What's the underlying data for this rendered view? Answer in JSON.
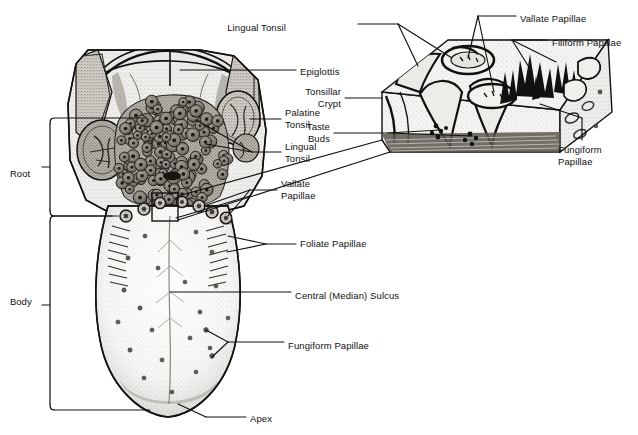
{
  "figure": {
    "type": "anatomical-diagram",
    "background": "#ffffff",
    "ink": "#000000"
  },
  "region_brackets": [
    {
      "id": "root",
      "label": "Root",
      "x": 10,
      "y": 168
    },
    {
      "id": "body",
      "label": "Body",
      "x": 10,
      "y": 296
    }
  ],
  "labels": [
    {
      "id": "lingual-tonsil-inset",
      "text": "Lingual Tonsil",
      "x": 286,
      "y": 22,
      "align": "right"
    },
    {
      "id": "vallate-papillae-inset",
      "text": "Vallate Papillae",
      "x": 520,
      "y": 13,
      "align": "left"
    },
    {
      "id": "filiform-papillae",
      "text": "Filiform Papillae",
      "x": 552,
      "y": 37,
      "align": "left"
    },
    {
      "id": "epiglottis",
      "text": "Epiglottis",
      "x": 300,
      "y": 66,
      "align": "left"
    },
    {
      "id": "palatine-tonsil",
      "text": "Palatine\nTonsil",
      "x": 285,
      "y": 107,
      "align": "left"
    },
    {
      "id": "tonsillar-crypt",
      "text": "Tonsillar\nCrypt",
      "x": 341,
      "y": 86,
      "align": "right"
    },
    {
      "id": "lingual-tonsil-main",
      "text": "Lingual\nTonsil",
      "x": 285,
      "y": 141,
      "align": "left"
    },
    {
      "id": "taste-buds",
      "text": "Taste\nBuds",
      "x": 330,
      "y": 121,
      "align": "right"
    },
    {
      "id": "fungiform-papillae-inset",
      "text": "Fungiform\nPapillae",
      "x": 558,
      "y": 144,
      "align": "left"
    },
    {
      "id": "vallate-papillae-main",
      "text": "Vallate\nPapillae",
      "x": 281,
      "y": 178,
      "align": "left"
    },
    {
      "id": "foliate-papillae",
      "text": "Foliate Papillae",
      "x": 300,
      "y": 238,
      "align": "left"
    },
    {
      "id": "central-median-sulcus",
      "text": "Central (Median) Sulcus",
      "x": 295,
      "y": 290,
      "align": "left"
    },
    {
      "id": "fungiform-papillae-main",
      "text": "Fungiform Papillae",
      "x": 288,
      "y": 340,
      "align": "left"
    },
    {
      "id": "apex",
      "text": "Apex",
      "x": 250,
      "y": 413,
      "align": "left"
    }
  ]
}
